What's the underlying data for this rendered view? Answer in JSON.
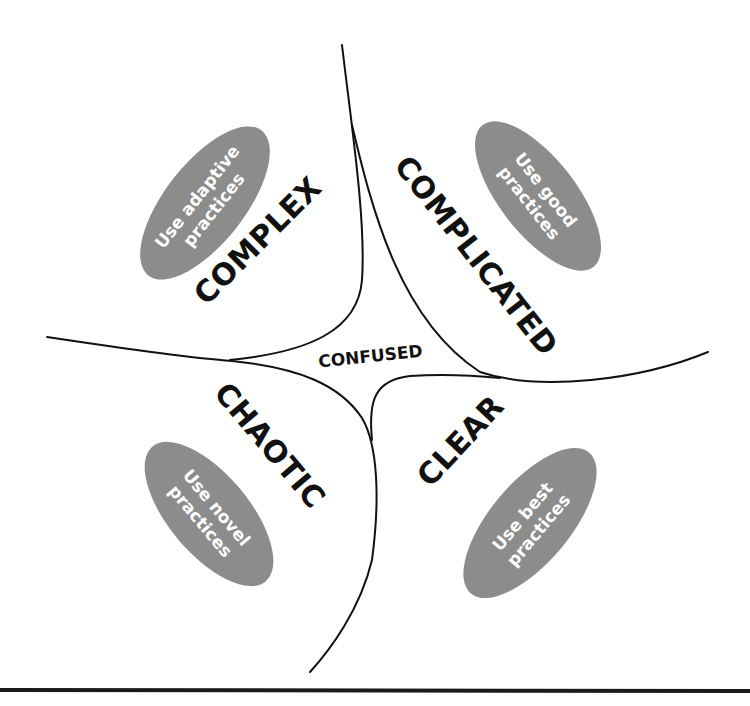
{
  "diagram": {
    "type": "Cynefin framework",
    "center": {
      "label": "CONFUSED"
    },
    "domains": [
      {
        "id": "complex",
        "label": "COMPLEX",
        "practice_line1": "Use adaptive",
        "practice_line2": "practices"
      },
      {
        "id": "complicated",
        "label": "COMPLICATED",
        "practice_line1": "Use good",
        "practice_line2": "practices"
      },
      {
        "id": "chaotic",
        "label": "CHAOTIC",
        "practice_line1": "Use novel",
        "practice_line2": "practices"
      },
      {
        "id": "clear",
        "label": "CLEAR",
        "practice_line1": "Use best",
        "practice_line2": "practices"
      }
    ],
    "colors": {
      "ellipse_fill": "#8c8c8c",
      "ellipse_text": "#ffffff",
      "line": "#111111",
      "background": "#ffffff"
    }
  }
}
